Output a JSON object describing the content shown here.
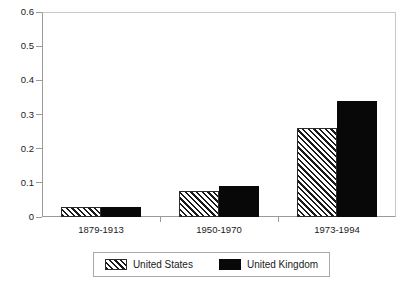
{
  "chart_data": {
    "type": "bar",
    "title": "",
    "subtitle": "",
    "xlabel": "",
    "ylabel": "",
    "categories": [
      "1879-1913",
      "1950-1970",
      "1973-1994"
    ],
    "series": [
      {
        "name": "United States",
        "values": [
          0.03,
          0.075,
          0.26
        ],
        "fill": "hatch-diagonal",
        "color": "#1a1a1a"
      },
      {
        "name": "United Kingdom",
        "values": [
          0.03,
          0.09,
          0.34
        ],
        "fill": "solid",
        "color": "#080808"
      }
    ],
    "ylim": [
      0,
      0.6
    ],
    "ytick_values": [
      0,
      0.1,
      0.2,
      0.3,
      0.4,
      0.5,
      0.6
    ],
    "ytick_labels": [
      "0",
      "0.1",
      "0.2",
      "0.3",
      "0.4",
      "0.5",
      "0.6"
    ],
    "grid": false,
    "legend_position": "bottom-center",
    "legend_entries": [
      "United States",
      "United Kingdom"
    ],
    "axis_color": "#9a9a9a",
    "background": "#ffffff"
  }
}
